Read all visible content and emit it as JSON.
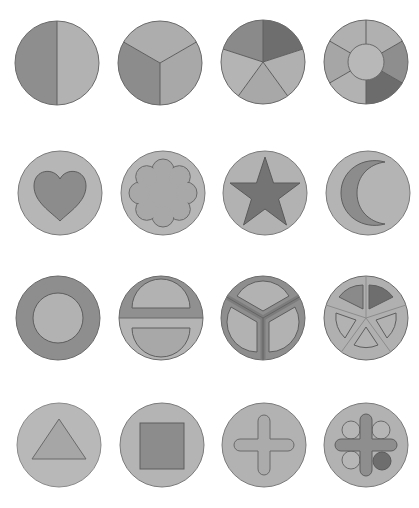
{
  "colors": {
    "light": "#b8b8b8",
    "mid": "#a0a0a0",
    "dark": "#8a8a8a",
    "darker": "#747474",
    "outline": "#6a6a6a"
  },
  "rows": [
    {
      "row": 1,
      "discs": [
        {
          "name": "halves",
          "label": "Circle split into 2 halves"
        },
        {
          "name": "thirds",
          "label": "Circle split into 3 sectors"
        },
        {
          "name": "fifths",
          "label": "Circle split into 5 sectors"
        },
        {
          "name": "sixths-ring",
          "label": "Ring of 6 sectors with center circle"
        }
      ]
    },
    {
      "row": 2,
      "discs": [
        {
          "name": "heart",
          "label": "Heart inset"
        },
        {
          "name": "flower",
          "label": "Flower inset"
        },
        {
          "name": "star",
          "label": "Star inset"
        },
        {
          "name": "crescent",
          "label": "Crescent moon inset"
        }
      ]
    },
    {
      "row": 3,
      "discs": [
        {
          "name": "ring-circle",
          "label": "Circle inset in ring"
        },
        {
          "name": "two-semicircles",
          "label": "Two semicircle insets"
        },
        {
          "name": "three-sectors-inset",
          "label": "Three sector insets"
        },
        {
          "name": "five-sectors-inset",
          "label": "Five sector insets"
        }
      ]
    },
    {
      "row": 4,
      "discs": [
        {
          "name": "triangle",
          "label": "Triangle inset"
        },
        {
          "name": "square",
          "label": "Square inset"
        },
        {
          "name": "cross",
          "label": "Cross inset"
        },
        {
          "name": "cross-circles",
          "label": "Cross with four circle insets"
        }
      ]
    }
  ]
}
